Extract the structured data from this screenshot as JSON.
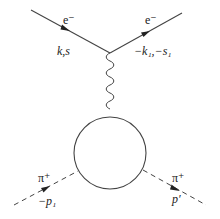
{
  "diagram": {
    "type": "feynman",
    "vertices": {
      "top": [
        110,
        53
      ],
      "blob_center": [
        110,
        153
      ],
      "blob_radius": 36
    },
    "particles": {
      "incoming_electron": {
        "label": "e⁻",
        "momentum": "k,s"
      },
      "outgoing_electron": {
        "label": "e⁻",
        "momentum": "−k₁,−s₁"
      },
      "incoming_pion": {
        "label": "π⁺",
        "momentum": "−p₁"
      },
      "outgoing_pion": {
        "label": "π⁺",
        "momentum": "p′"
      }
    },
    "propagator": "photon (wavy line)",
    "colors": {
      "line": "#444444",
      "text": "#222222"
    }
  }
}
